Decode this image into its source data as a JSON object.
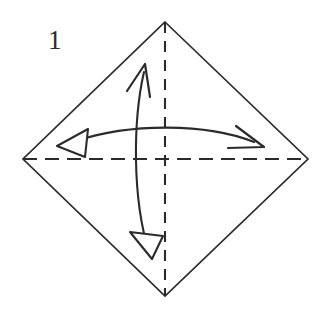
{
  "figure": {
    "step_number": "1",
    "title": "",
    "caption": "",
    "background_color": "#ffffff",
    "ink_color": "#2b2b2b"
  },
  "diagram": {
    "type": "origami-fold-instruction",
    "shape_name": "square-rotated-45-degrees",
    "canvas": {
      "width": 329,
      "height": 309
    },
    "paper_outline": {
      "name": "diamond-outline",
      "stroke_color": "#2b2b2b",
      "stroke_width": 1.6,
      "fill": "#ffffff",
      "vertices": [
        {
          "label": "top",
          "x": 165,
          "y": 22
        },
        {
          "label": "right",
          "x": 308,
          "y": 159
        },
        {
          "label": "bottom",
          "x": 165,
          "y": 296
        },
        {
          "label": "left",
          "x": 23,
          "y": 159
        }
      ]
    },
    "crease_lines": [
      {
        "name": "vertical-crease",
        "orientation": "vertical",
        "style": "dashed",
        "stroke_color": "#2b2b2b",
        "stroke_width": 2.0,
        "dash_pattern": "11,8",
        "from": {
          "x": 165,
          "y": 22
        },
        "to": {
          "x": 165,
          "y": 296
        }
      },
      {
        "name": "horizontal-crease",
        "orientation": "horizontal",
        "style": "dashed",
        "stroke_color": "#2b2b2b",
        "stroke_width": 2.0,
        "dash_pattern": "14,8",
        "from": {
          "x": 23,
          "y": 159
        },
        "to": {
          "x": 308,
          "y": 159
        }
      }
    ],
    "arrows": [
      {
        "name": "vertical-double-arrow",
        "orientation": "vertical",
        "double_headed": true,
        "stroke_color": "#2b2b2b",
        "stroke_width": 2.0,
        "curve": "arc-bulging-right",
        "path": "M 144 70 C 134 118, 132 200, 150 256",
        "head_start": {
          "name": "arrowhead-up-open",
          "style": "open-v",
          "tip": {
            "x": 145,
            "y": 64
          }
        },
        "head_end": {
          "name": "arrowhead-down-hollow",
          "style": "hollow-triangle",
          "tip": {
            "x": 152,
            "y": 259
          }
        }
      },
      {
        "name": "horizontal-double-arrow",
        "orientation": "horizontal",
        "double_headed": true,
        "stroke_color": "#2b2b2b",
        "stroke_width": 2.0,
        "curve": "arc-bulging-up",
        "path": "M 74 142 C 128 124, 206 124, 256 142",
        "head_start": {
          "name": "arrowhead-left-hollow",
          "style": "hollow-triangle",
          "tip": {
            "x": 57,
            "y": 146
          }
        },
        "head_end": {
          "name": "arrowhead-right-open",
          "style": "open-v",
          "tip": {
            "x": 264,
            "y": 147
          }
        }
      }
    ]
  }
}
